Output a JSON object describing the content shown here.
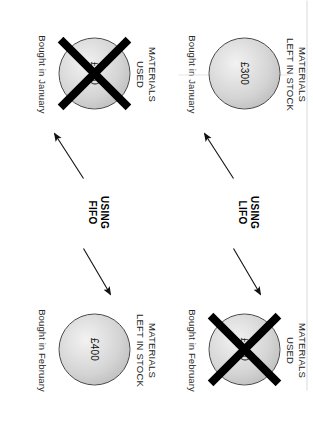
{
  "diagram": {
    "title_text": "",
    "colors": {
      "sphere_fill_light": "#f2f2f2",
      "sphere_fill_dark": "#b0b0b0",
      "sphere_border": "#4a4a4a",
      "cross": "#000000",
      "text": "#1a1a1a",
      "background": "#ffffff"
    },
    "groups": [
      {
        "id": "fifo",
        "method_label": "USING\nFIFO",
        "left_item": {
          "label": "MATERIALS\nUSED",
          "amount": "£300",
          "caption": "Bought in January",
          "crossed_out": true
        },
        "right_item": {
          "label": "MATERIALS\nLEFT IN STOCK",
          "amount": "£400",
          "caption": "Bought in February",
          "crossed_out": false
        }
      },
      {
        "id": "lifo",
        "method_label": "USING\nLIFO",
        "left_item": {
          "label": "MATERIALS\nLEFT IN STOCK",
          "amount": "£300",
          "caption": "Bought in January",
          "crossed_out": false
        },
        "right_item": {
          "label": "MATERIALS\nUSED",
          "amount": "£400",
          "caption": "Bought in February",
          "crossed_out": true
        }
      }
    ]
  }
}
